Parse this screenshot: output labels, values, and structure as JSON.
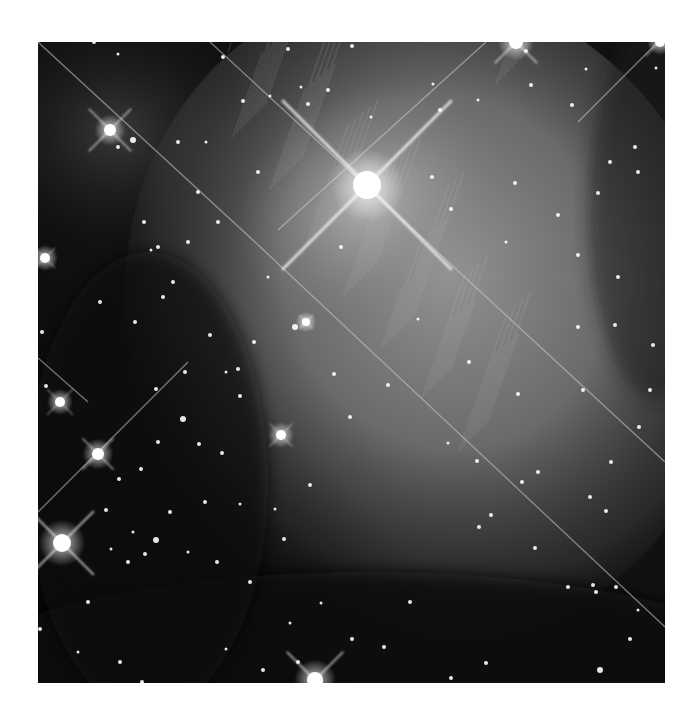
{
  "image": {
    "subject": "nebula star field",
    "frame": {
      "x": 38,
      "y": 42,
      "width": 627,
      "height": 641
    },
    "colors": {
      "background": "#0b0b0b",
      "nebula": "#8a8a8a",
      "nebula_core": "#b8b8b8",
      "star": "#ffffff",
      "spike": "#d8d8d8"
    },
    "bright_stars": [
      {
        "x": 329,
        "y": 143,
        "r": 14,
        "spike": 120
      },
      {
        "x": 72,
        "y": 88,
        "r": 6,
        "spike": 30
      },
      {
        "x": 24,
        "y": 501,
        "r": 9,
        "spike": 45
      },
      {
        "x": 60,
        "y": 412,
        "r": 6,
        "spike": 22
      },
      {
        "x": 7,
        "y": 216,
        "r": 5,
        "spike": 14
      },
      {
        "x": 22,
        "y": 360,
        "r": 5,
        "spike": 18
      },
      {
        "x": 243,
        "y": 393,
        "r": 5,
        "spike": 16
      },
      {
        "x": 277,
        "y": 638,
        "r": 8,
        "spike": 40
      },
      {
        "x": 478,
        "y": 0,
        "r": 7,
        "spike": 30
      },
      {
        "x": 268,
        "y": 280,
        "r": 4,
        "spike": 10
      },
      {
        "x": 622,
        "y": 0,
        "r": 5,
        "spike": 20
      }
    ],
    "stars": [
      [
        56,
        0,
        2
      ],
      [
        80,
        12,
        1.5
      ],
      [
        185,
        15,
        2
      ],
      [
        250,
        7,
        2
      ],
      [
        263,
        45,
        1.5
      ],
      [
        205,
        59,
        2
      ],
      [
        314,
        4,
        2
      ],
      [
        232,
        54,
        1.5
      ],
      [
        270,
        62,
        2
      ],
      [
        333,
        75,
        1.5
      ],
      [
        395,
        42,
        1.5
      ],
      [
        402,
        68,
        2
      ],
      [
        488,
        9,
        2
      ],
      [
        493,
        43,
        2
      ],
      [
        440,
        58,
        1.5
      ],
      [
        534,
        63,
        2
      ],
      [
        548,
        27,
        1.5
      ],
      [
        618,
        26,
        1.5
      ],
      [
        597,
        105,
        2
      ],
      [
        572,
        120,
        2
      ],
      [
        600,
        130,
        2
      ],
      [
        560,
        151,
        2
      ],
      [
        520,
        173,
        2
      ],
      [
        477,
        141,
        2
      ],
      [
        540,
        213,
        2
      ],
      [
        580,
        235,
        2
      ],
      [
        468,
        200,
        1.5
      ],
      [
        413,
        167,
        2
      ],
      [
        394,
        135,
        2
      ],
      [
        303,
        205,
        2
      ],
      [
        290,
        48,
        2
      ],
      [
        95,
        98,
        3
      ],
      [
        80,
        105,
        2
      ],
      [
        140,
        100,
        2
      ],
      [
        220,
        130,
        2
      ],
      [
        168,
        100,
        1.5
      ],
      [
        180,
        180,
        2
      ],
      [
        120,
        205,
        2
      ],
      [
        106,
        180,
        2
      ],
      [
        62,
        260,
        2
      ],
      [
        97,
        280,
        2
      ],
      [
        113,
        208,
        1.5
      ],
      [
        150,
        200,
        2
      ],
      [
        188,
        330,
        1.5
      ],
      [
        135,
        240,
        2
      ],
      [
        172,
        293,
        2
      ],
      [
        145,
        377,
        3
      ],
      [
        120,
        400,
        2
      ],
      [
        118,
        347,
        2
      ],
      [
        167,
        460,
        2
      ],
      [
        161,
        402,
        2
      ],
      [
        103,
        427,
        2
      ],
      [
        81,
        437,
        2
      ],
      [
        68,
        468,
        2
      ],
      [
        73,
        507,
        1.5
      ],
      [
        90,
        520,
        2
      ],
      [
        216,
        300,
        2
      ],
      [
        200,
        327,
        2
      ],
      [
        147,
        330,
        2
      ],
      [
        184,
        411,
        2
      ],
      [
        202,
        354,
        2
      ],
      [
        8,
        344,
        2
      ],
      [
        4,
        290,
        2
      ],
      [
        125,
        255,
        2
      ],
      [
        160,
        150,
        2
      ],
      [
        230,
        235,
        1.5
      ],
      [
        257,
        285,
        3
      ],
      [
        296,
        332,
        2
      ],
      [
        272,
        443,
        2
      ],
      [
        312,
        375,
        2
      ],
      [
        350,
        343,
        2
      ],
      [
        380,
        277,
        1.5
      ],
      [
        431,
        320,
        2
      ],
      [
        410,
        401,
        1.5
      ],
      [
        439,
        419,
        2
      ],
      [
        453,
        473,
        2
      ],
      [
        480,
        352,
        2
      ],
      [
        540,
        285,
        2
      ],
      [
        577,
        283,
        2
      ],
      [
        545,
        348,
        2
      ],
      [
        552,
        455,
        2
      ],
      [
        573,
        420,
        2
      ],
      [
        601,
        385,
        2
      ],
      [
        612,
        348,
        2
      ],
      [
        568,
        469,
        2
      ],
      [
        615,
        303,
        2
      ],
      [
        497,
        506,
        2
      ],
      [
        484,
        440,
        2
      ],
      [
        441,
        485,
        2
      ],
      [
        500,
        430,
        2
      ],
      [
        530,
        545,
        2
      ],
      [
        558,
        550,
        2
      ],
      [
        578,
        545,
        2
      ],
      [
        592,
        597,
        2
      ],
      [
        562,
        628,
        3
      ],
      [
        555,
        543,
        2
      ],
      [
        600,
        568,
        1.5
      ],
      [
        372,
        560,
        2
      ],
      [
        346,
        605,
        2
      ],
      [
        314,
        597,
        2
      ],
      [
        413,
        636,
        2
      ],
      [
        448,
        621,
        2
      ],
      [
        283,
        561,
        1.5
      ],
      [
        252,
        581,
        1.5
      ],
      [
        212,
        540,
        2
      ],
      [
        188,
        607,
        1.5
      ],
      [
        260,
        620,
        2
      ],
      [
        225,
        628,
        2
      ],
      [
        179,
        520,
        2
      ],
      [
        50,
        560,
        2
      ],
      [
        82,
        620,
        2
      ],
      [
        63,
        652,
        2
      ],
      [
        40,
        610,
        1.5
      ],
      [
        104,
        640,
        2
      ],
      [
        2,
        587,
        2
      ],
      [
        132,
        470,
        2
      ],
      [
        202,
        462,
        1.5
      ],
      [
        237,
        467,
        1.5
      ],
      [
        246,
        497,
        2
      ],
      [
        150,
        510,
        1.5
      ],
      [
        118,
        498,
        3
      ],
      [
        107,
        512,
        2
      ],
      [
        95,
        490,
        1.5
      ]
    ],
    "streaks": [
      {
        "x1": 0,
        "y1": 0,
        "x2": 218,
        "y2": 201
      },
      {
        "x1": 172,
        "y1": 0,
        "x2": 627,
        "y2": 420
      },
      {
        "x1": 218,
        "y1": 201,
        "x2": 627,
        "y2": 585
      },
      {
        "x1": 0,
        "y1": 470,
        "x2": 150,
        "y2": 320
      },
      {
        "x1": 0,
        "y1": 316,
        "x2": 50,
        "y2": 360
      },
      {
        "x1": 448,
        "y1": 0,
        "x2": 240,
        "y2": 188
      },
      {
        "x1": 620,
        "y1": 0,
        "x2": 540,
        "y2": 80
      }
    ]
  }
}
